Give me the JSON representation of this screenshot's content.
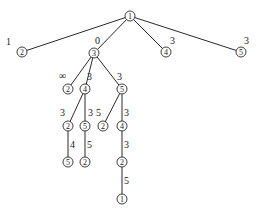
{
  "diagram": {
    "type": "search-tree",
    "nodes": [
      {
        "id": "n0",
        "label": "1",
        "x": 130,
        "y": 16
      },
      {
        "id": "n1",
        "label": "2",
        "x": 22,
        "y": 52
      },
      {
        "id": "n2",
        "label": "3",
        "x": 94,
        "y": 53
      },
      {
        "id": "n3",
        "label": "4",
        "x": 166,
        "y": 52
      },
      {
        "id": "n4",
        "label": "5",
        "x": 241,
        "y": 52
      },
      {
        "id": "n5",
        "label": "2",
        "x": 68,
        "y": 89
      },
      {
        "id": "n6",
        "label": "4",
        "x": 85,
        "y": 89
      },
      {
        "id": "n7",
        "label": "5",
        "x": 122,
        "y": 89
      },
      {
        "id": "n8",
        "label": "2",
        "x": 68,
        "y": 126
      },
      {
        "id": "n9",
        "label": "5",
        "x": 85,
        "y": 126
      },
      {
        "id": "n10",
        "label": "2",
        "x": 103,
        "y": 126
      },
      {
        "id": "n11",
        "label": "4",
        "x": 122,
        "y": 126
      },
      {
        "id": "n12",
        "label": "5",
        "x": 68,
        "y": 162
      },
      {
        "id": "n13",
        "label": "2",
        "x": 85,
        "y": 162
      },
      {
        "id": "n14",
        "label": "2",
        "x": 122,
        "y": 162
      },
      {
        "id": "n15",
        "label": "1",
        "x": 122,
        "y": 199
      }
    ],
    "edges": [
      {
        "from": "n0",
        "to": "n1",
        "weight": "1",
        "lx": 6,
        "ly": 45
      },
      {
        "from": "n0",
        "to": "n2",
        "weight": "0",
        "lx": 95,
        "ly": 44
      },
      {
        "from": "n0",
        "to": "n3",
        "weight": "3",
        "lx": 170,
        "ly": 44
      },
      {
        "from": "n0",
        "to": "n4",
        "weight": "3",
        "lx": 244,
        "ly": 44
      },
      {
        "from": "n2",
        "to": "n5",
        "weight": "∞",
        "lx": 59,
        "ly": 79
      },
      {
        "from": "n2",
        "to": "n6",
        "weight": "3",
        "lx": 87,
        "ly": 80
      },
      {
        "from": "n2",
        "to": "n7",
        "weight": "3",
        "lx": 117,
        "ly": 80
      },
      {
        "from": "n6",
        "to": "n8",
        "weight": "3",
        "lx": 60,
        "ly": 116
      },
      {
        "from": "n6",
        "to": "n9",
        "weight": "3",
        "lx": 88,
        "ly": 116
      },
      {
        "from": "n7",
        "to": "n10",
        "weight": "5",
        "lx": 96,
        "ly": 116
      },
      {
        "from": "n7",
        "to": "n11",
        "weight": "3",
        "lx": 124,
        "ly": 116
      },
      {
        "from": "n8",
        "to": "n12",
        "weight": "4",
        "lx": 70,
        "ly": 148
      },
      {
        "from": "n9",
        "to": "n13",
        "weight": "5",
        "lx": 87,
        "ly": 148
      },
      {
        "from": "n11",
        "to": "n14",
        "weight": "3",
        "lx": 124,
        "ly": 148
      },
      {
        "from": "n14",
        "to": "n15",
        "weight": "5",
        "lx": 124,
        "ly": 184
      }
    ]
  }
}
